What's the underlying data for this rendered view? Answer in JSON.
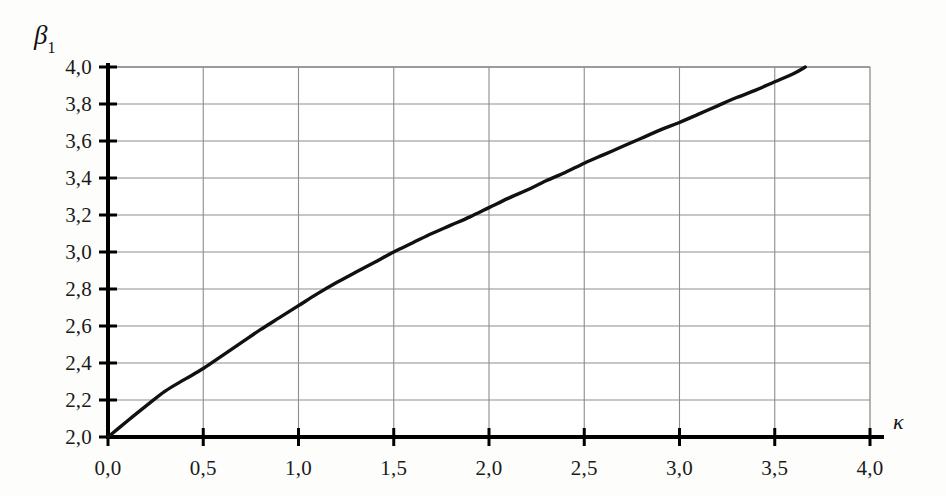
{
  "figure": {
    "y_axis_name": "β",
    "y_axis_subscript": "1",
    "x_axis_name": "κ",
    "background_color": "#fdfdfb",
    "curve_color": "#111111",
    "grid_color": "#8d8d8d",
    "axis_color": "#000000"
  },
  "chart_data": {
    "type": "line",
    "title": "",
    "subtitle": "",
    "xlabel": "κ",
    "ylabel": "β₁",
    "xlim": [
      0.0,
      4.0
    ],
    "ylim": [
      2.0,
      4.0
    ],
    "grid": true,
    "legend": "none",
    "x_ticks": [
      0.0,
      0.5,
      1.0,
      1.5,
      2.0,
      2.5,
      3.0,
      3.5,
      4.0
    ],
    "x_tick_labels": [
      "0,0",
      "0,5",
      "1,0",
      "1,5",
      "2,0",
      "2,5",
      "3,0",
      "3,5",
      "4,0"
    ],
    "y_ticks": [
      2.0,
      2.2,
      2.4,
      2.6,
      2.8,
      3.0,
      3.2,
      3.4,
      3.6,
      3.8,
      4.0
    ],
    "y_tick_labels": [
      "2,0",
      "2,2",
      "2,4",
      "2,6",
      "2,8",
      "3,0",
      "3,2",
      "3,4",
      "3,6",
      "3,8",
      "4,0"
    ],
    "x_minor_gridlines": [
      0.5,
      1.0,
      1.5,
      2.0,
      2.5,
      3.0,
      3.5
    ],
    "series": [
      {
        "name": "beta1(kappa)",
        "x": [
          0.0,
          0.1,
          0.2,
          0.3,
          0.4,
          0.5,
          0.6,
          0.7,
          0.8,
          0.9,
          1.0,
          1.1,
          1.2,
          1.3,
          1.4,
          1.5,
          1.6,
          1.7,
          1.8,
          1.9,
          2.0,
          2.1,
          2.2,
          2.3,
          2.4,
          2.5,
          2.6,
          2.7,
          2.8,
          2.9,
          3.0,
          3.1,
          3.2,
          3.3,
          3.4,
          3.5,
          3.6,
          3.66
        ],
        "y": [
          2.0,
          2.085,
          2.168,
          2.248,
          2.31,
          2.37,
          2.44,
          2.51,
          2.58,
          2.645,
          2.71,
          2.775,
          2.835,
          2.89,
          2.945,
          3.0,
          3.05,
          3.1,
          3.145,
          3.19,
          3.24,
          3.29,
          3.335,
          3.385,
          3.43,
          3.48,
          3.525,
          3.57,
          3.615,
          3.66,
          3.7,
          3.745,
          3.79,
          3.835,
          3.875,
          3.92,
          3.965,
          4.0
        ]
      }
    ],
    "annotations": []
  }
}
